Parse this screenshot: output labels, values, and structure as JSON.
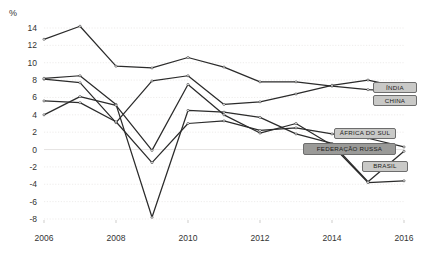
{
  "axis": {
    "unit_label": "%",
    "y_ticks": [
      14,
      12,
      10,
      8,
      6,
      4,
      2,
      0,
      -2,
      -4,
      -6,
      -8
    ],
    "x_ticks": [
      "2006",
      "2008",
      "2010",
      "2012",
      "2014",
      "2016"
    ]
  },
  "callouts": {
    "india": "ÍNDIA",
    "china": "CHINA",
    "africa": "ÁFRICA DO SUL",
    "russia": "FEDERAÇÃO RUSSA",
    "brasil": "BRASIL"
  },
  "chart_data": {
    "type": "line",
    "title": "",
    "xlabel": "",
    "ylabel": "%",
    "x": [
      2006,
      2007,
      2008,
      2009,
      2010,
      2011,
      2012,
      2013,
      2014,
      2015,
      2016
    ],
    "xlim": [
      2006,
      2016
    ],
    "ylim": [
      -8,
      14
    ],
    "ytick_step": 2,
    "grid": true,
    "legend_position": "right-inline-callouts",
    "series": [
      {
        "name": "CHINA",
        "color": "#2b2b2b",
        "values": [
          12.7,
          14.2,
          9.6,
          9.4,
          10.6,
          9.5,
          7.8,
          7.8,
          7.3,
          6.9,
          6.7
        ]
      },
      {
        "name": "ÍNDIA",
        "color": "#2b2b2b",
        "values": [
          8.1,
          7.7,
          3.1,
          7.9,
          8.5,
          5.2,
          5.5,
          6.4,
          7.4,
          8.0,
          7.1
        ]
      },
      {
        "name": "FEDERAÇÃO RUSSA",
        "color": "#2b2b2b",
        "values": [
          8.2,
          8.5,
          5.2,
          -7.8,
          4.5,
          4.3,
          3.7,
          1.8,
          0.7,
          -3.7,
          -0.2
        ]
      },
      {
        "name": "ÁFRICA DO SUL",
        "color": "#2b2b2b",
        "values": [
          5.6,
          5.4,
          3.2,
          -1.5,
          3.0,
          3.3,
          2.2,
          2.5,
          1.8,
          1.3,
          0.3
        ]
      },
      {
        "name": "BRASIL",
        "color": "#2b2b2b",
        "values": [
          4.0,
          6.1,
          5.1,
          -0.1,
          7.5,
          4.0,
          1.9,
          3.0,
          0.5,
          -3.8,
          -3.6
        ]
      }
    ]
  }
}
